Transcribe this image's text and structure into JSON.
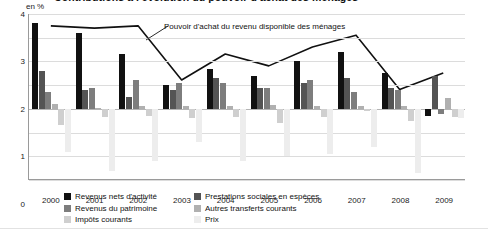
{
  "title": "Contributions à l'évolution du pouvoir d'achat des ménages",
  "unit": "en %",
  "annotation": "Pouvoir d'achat du revenu disponible des ménages",
  "axis": {
    "yticks": [
      "4",
      "3",
      "2",
      "1",
      "0",
      "-1",
      "-2",
      "-3"
    ],
    "xticks": [
      "2000",
      "2001",
      "2002",
      "2003",
      "2004",
      "2005",
      "2006",
      "2007",
      "2008",
      "2009"
    ]
  },
  "legend": {
    "left": [
      {
        "label": "Revenus nets d'activité",
        "color": "#111111"
      },
      {
        "label": "Revenus du patrimoine",
        "color": "#7d7d7d"
      },
      {
        "label": "Impôts courants",
        "color": "#cfcfcf"
      }
    ],
    "right": [
      {
        "label": "Prestations sociales en espèces",
        "color": "#545454"
      },
      {
        "label": "Autres transferts courants",
        "color": "#b0b0b0"
      },
      {
        "label": "Prix",
        "color": "#ededed"
      }
    ]
  },
  "chart_data": {
    "type": "bar",
    "title": "Contributions à l'évolution du pouvoir d'achat des ménages",
    "xlabel": "",
    "ylabel": "en %",
    "ylim": [
      -3,
      4
    ],
    "ytick_step": 1,
    "grid": true,
    "legend_position": "below",
    "categories": [
      "2000",
      "2001",
      "2002",
      "2003",
      "2004",
      "2005",
      "2006",
      "2007",
      "2008",
      "2009"
    ],
    "series": [
      {
        "name": "Revenus nets d'activité",
        "color": "#111111",
        "values": [
          3.6,
          3.2,
          2.3,
          1.0,
          1.7,
          1.4,
          2.0,
          2.4,
          1.5,
          -0.3
        ]
      },
      {
        "name": "Prestations sociales en espèces",
        "color": "#545454",
        "values": [
          1.6,
          0.8,
          0.5,
          0.8,
          1.3,
          0.9,
          1.1,
          1.3,
          0.9,
          1.4
        ]
      },
      {
        "name": "Revenus du patrimoine",
        "color": "#7d7d7d",
        "values": [
          0.7,
          0.9,
          1.2,
          1.1,
          1.1,
          0.9,
          1.2,
          0.7,
          0.8,
          -0.2
        ]
      },
      {
        "name": "Autres transferts courants",
        "color": "#b0b0b0",
        "values": [
          0.2,
          0.05,
          0.1,
          0.1,
          0.1,
          0.15,
          0.1,
          0.1,
          0.1,
          0.45
        ]
      },
      {
        "name": "Impôts courants",
        "color": "#cfcfcf",
        "values": [
          -0.7,
          -0.35,
          -0.3,
          -0.4,
          -0.35,
          -0.6,
          -0.35,
          -0.1,
          -0.5,
          -0.35
        ]
      },
      {
        "name": "Prix",
        "color": "#ededed",
        "values": [
          -1.8,
          -2.6,
          -2.2,
          -1.4,
          -2.2,
          -2.0,
          -1.9,
          -1.6,
          -2.7,
          -0.4
        ]
      }
    ],
    "line_series": {
      "name": "Pouvoir d'achat du revenu disponible des ménages",
      "color": "#111111",
      "values": [
        3.5,
        3.4,
        3.5,
        1.2,
        2.3,
        1.8,
        2.6,
        3.1,
        0.8,
        1.5
      ]
    }
  }
}
